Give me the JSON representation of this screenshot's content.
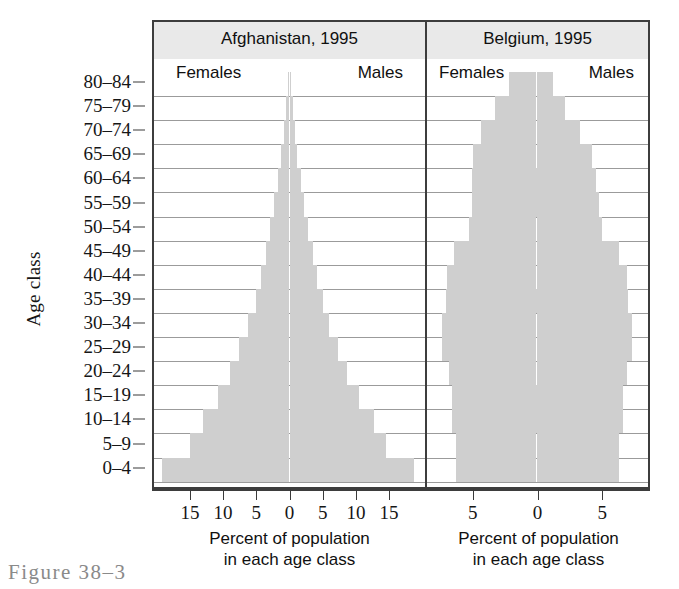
{
  "figure": {
    "caption": "Figure  38–3",
    "y_axis_title": "Age class",
    "x_axis_title_line1": "Percent of population",
    "x_axis_title_line2": "in each age class",
    "bar_color": "#cfcfcf",
    "title_band_color": "#e9e9e9",
    "axis_color": "#3d3d3d",
    "grid_color": "#9b9b9b"
  },
  "age_classes": [
    "0–4",
    "5–9",
    "10–14",
    "15–19",
    "20–24",
    "25–29",
    "30–34",
    "35–39",
    "40–44",
    "45–49",
    "50–54",
    "55–59",
    "60–64",
    "65–69",
    "70–74",
    "75–79",
    "80–84"
  ],
  "panels": [
    {
      "id": "afghanistan",
      "title": "Afghanistan, 1995",
      "females_label": "Females",
      "males_label": "Males",
      "x_ticks": [
        15,
        10,
        5,
        0,
        5,
        10,
        15
      ],
      "x_tick_labels": [
        "15",
        "10",
        "5",
        "0",
        "5",
        "10",
        "15"
      ],
      "x_max": 19.5
    },
    {
      "id": "belgium",
      "title": "Belgium, 1995",
      "females_label": "Females",
      "males_label": "Males",
      "x_ticks": [
        5,
        0,
        5
      ],
      "x_tick_labels": [
        "5",
        "0",
        "5"
      ],
      "x_max": 8.0
    }
  ],
  "chart_data": {
    "type": "bar",
    "subtype": "population-pyramid",
    "xlabel": "Percent of population in each age class",
    "ylabel": "Age class",
    "grid": true,
    "legend": "in-panel labels: Females (left), Males (right)",
    "categories": [
      "0–4",
      "5–9",
      "10–14",
      "15–19",
      "20–24",
      "25–29",
      "30–34",
      "35–39",
      "40–44",
      "45–49",
      "50–54",
      "55–59",
      "60–64",
      "65–69",
      "70–74",
      "75–79",
      "80–84"
    ],
    "panels": [
      {
        "name": "Afghanistan, 1995",
        "xlim": [
          -19.5,
          19.5
        ],
        "series": [
          {
            "name": "Females",
            "side": "left",
            "values": [
              19.2,
              15.0,
              13.0,
              10.8,
              9.0,
              7.6,
              6.2,
              5.1,
              4.3,
              3.6,
              2.9,
              2.3,
              1.8,
              1.3,
              0.9,
              0.5,
              0.3
            ]
          },
          {
            "name": "Males",
            "side": "right",
            "values": [
              18.8,
              14.6,
              12.7,
              10.5,
              8.7,
              7.3,
              6.0,
              5.0,
              4.2,
              3.5,
              2.8,
              2.2,
              1.7,
              1.2,
              0.8,
              0.5,
              0.3
            ]
          }
        ]
      },
      {
        "name": "Belgium, 1995",
        "xlim": [
          -8.0,
          8.0
        ],
        "series": [
          {
            "name": "Females",
            "side": "left",
            "values": [
              6.2,
              6.2,
              6.5,
              6.5,
              6.8,
              7.3,
              7.3,
              7.0,
              6.9,
              6.4,
              5.2,
              5.0,
              5.0,
              4.9,
              4.3,
              3.2,
              2.1
            ]
          },
          {
            "name": "Males",
            "side": "right",
            "values": [
              6.4,
              6.4,
              6.7,
              6.7,
              7.0,
              7.4,
              7.4,
              7.1,
              7.0,
              6.4,
              5.1,
              4.8,
              4.6,
              4.3,
              3.4,
              2.2,
              1.3
            ]
          }
        ]
      }
    ]
  }
}
